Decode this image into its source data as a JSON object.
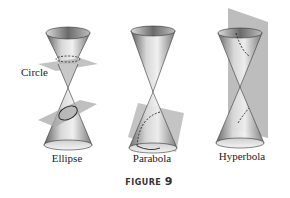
{
  "figure": {
    "caption_word": "FIGURE",
    "caption_number": "9",
    "panels": [
      {
        "id": "ellipse",
        "label": "Ellipse",
        "extra_label": "Circle",
        "plane": "horizontal plane (circle) above, tilted plane (ellipse) below"
      },
      {
        "id": "parabola",
        "label": "Parabola",
        "plane": "plane parallel to cone side"
      },
      {
        "id": "hyperbola",
        "label": "Hyperbola",
        "plane": "vertical plane cutting both nappes"
      }
    ]
  },
  "colors": {
    "cone_dark": "#6e6e6e",
    "cone_light": "#e8e8e8",
    "plane": "#b5b5b5",
    "outline": "#333333"
  }
}
